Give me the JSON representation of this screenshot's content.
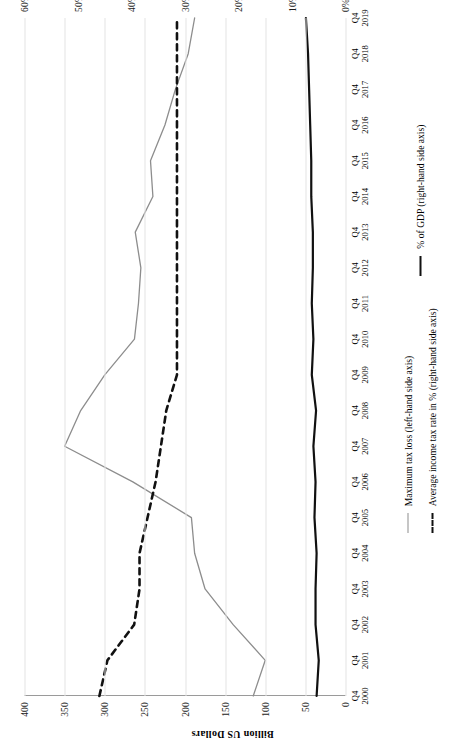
{
  "chart_data": {
    "type": "line",
    "title": "",
    "subtitle": "",
    "xlabel": "",
    "ylabel": "Billion US Dollars",
    "y2label": "",
    "orientation": "image rotated 90 degrees counter-clockwise",
    "grid": true,
    "legend_position": "bottom",
    "x": [
      "Q4 2000",
      "Q4 2001",
      "Q4 2002",
      "Q4 2003",
      "Q4 2004",
      "Q4 2005",
      "Q4 2006",
      "Q4 2007",
      "Q4 2008",
      "Q4 2009",
      "Q4 2010",
      "Q4 2011",
      "Q4 2012",
      "Q4 2013",
      "Q4 2014",
      "Q4 2015",
      "Q4 2016",
      "Q4 2017",
      "Q4 2018",
      "Q4 2019"
    ],
    "x_tick_quarter": "Q4",
    "x_years": [
      2000,
      2001,
      2002,
      2003,
      2004,
      2005,
      2006,
      2007,
      2008,
      2009,
      2010,
      2011,
      2012,
      2013,
      2014,
      2015,
      2016,
      2017,
      2018,
      2019
    ],
    "ylim": [
      0,
      400
    ],
    "yticks": [
      0,
      50,
      100,
      150,
      200,
      250,
      300,
      350,
      400
    ],
    "ytick_labels": [
      "0",
      "50",
      "100",
      "150",
      "200",
      "250",
      "300",
      "350",
      "400"
    ],
    "y2lim": [
      0,
      60
    ],
    "y2ticks": [
      0,
      10,
      20,
      30,
      40,
      50,
      60
    ],
    "y2tick_labels": [
      "0%",
      "10%",
      "20%",
      "30%",
      "40%",
      "50%",
      "60%"
    ],
    "series": [
      {
        "name": "Maximum tax loss (left-hand side axis)",
        "axis": "left",
        "style": "solid",
        "color": "#8d8d8d",
        "unit": "Billion US Dollars",
        "values": [
          115,
          100,
          140,
          175,
          188,
          192,
          265,
          350,
          330,
          300,
          263,
          258,
          255,
          262,
          240,
          243,
          225,
          212,
          196,
          188
        ]
      },
      {
        "name": "Average income tax rate in % (right-hand side axis)",
        "axis": "right",
        "style": "dashed",
        "color": "#111111",
        "unit": "%",
        "values": [
          46.0,
          44.5,
          39.5,
          38.5,
          38.5,
          37.0,
          35.5,
          34.5,
          33.5,
          31.5,
          31.5,
          31.5,
          31.5,
          31.5,
          31.5,
          31.5,
          31.5,
          31.5,
          31.5,
          31.5
        ]
      },
      {
        "name": "% of GDP (right-hand side axis)",
        "axis": "right",
        "style": "solid-bold",
        "color": "#111111",
        "unit": "%",
        "values": [
          5.4,
          5.0,
          5.6,
          5.6,
          5.4,
          5.8,
          5.6,
          6.0,
          5.5,
          6.3,
          6.0,
          6.3,
          6.1,
          6.1,
          6.4,
          6.4,
          6.6,
          6.8,
          7.0,
          7.4
        ]
      }
    ]
  },
  "legend": {
    "items": [
      {
        "label": "Maximum tax loss (left-hand side axis)",
        "swatch": "gray-solid-line"
      },
      {
        "label": "Average income tax rate in % (right-hand side axis)",
        "swatch": "black-dashed-line"
      },
      {
        "label": "% of GDP (right-hand side axis)",
        "swatch": "black-solid-line"
      }
    ]
  },
  "axes": {
    "left_title": "Billion US Dollars"
  },
  "colors": {
    "series_gray": "#8d8d8d",
    "series_black": "#111111",
    "gridline": "#e3e3e3",
    "axis": "#9a9a9a",
    "background": "#ffffff"
  }
}
